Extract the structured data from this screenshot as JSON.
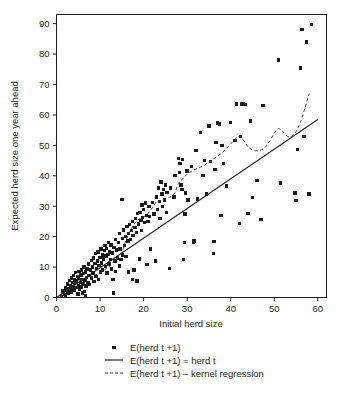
{
  "chart_data": {
    "type": "scatter",
    "title": "",
    "xlabel": "Initial herd size",
    "ylabel": "Expected herd size one year ahead",
    "xlim": [
      0,
      62
    ],
    "ylim": [
      0,
      93
    ],
    "xticks": [
      0,
      10,
      20,
      30,
      40,
      50,
      60
    ],
    "yticks": [
      0,
      10,
      20,
      30,
      40,
      50,
      60,
      70,
      80,
      90
    ],
    "grid": false,
    "legend_position": "bottom-center",
    "marker": "square",
    "marker_color": "#1a1a1a",
    "line_color": "#231f20",
    "points": [
      [
        1.2,
        0.3
      ],
      [
        1.5,
        2.1
      ],
      [
        1.8,
        1.0
      ],
      [
        2.0,
        3.2
      ],
      [
        2.1,
        0.6
      ],
      [
        2.3,
        2.6
      ],
      [
        2.5,
        4.4
      ],
      [
        2.6,
        1.5
      ],
      [
        2.8,
        3.0
      ],
      [
        3.0,
        5.6
      ],
      [
        3.1,
        2.2
      ],
      [
        3.2,
        4.0
      ],
      [
        3.4,
        6.4
      ],
      [
        3.5,
        1.8
      ],
      [
        3.6,
        3.5
      ],
      [
        3.8,
        5.0
      ],
      [
        3.9,
        7.2
      ],
      [
        4.0,
        2.5
      ],
      [
        4.1,
        4.6
      ],
      [
        4.2,
        6.0
      ],
      [
        4.4,
        8.2
      ],
      [
        4.5,
        3.2
      ],
      [
        4.6,
        5.4
      ],
      [
        4.8,
        7.0
      ],
      [
        4.9,
        1.2
      ],
      [
        5.0,
        4.0
      ],
      [
        5.1,
        6.2
      ],
      [
        5.2,
        8.6
      ],
      [
        5.3,
        2.8
      ],
      [
        5.5,
        5.0
      ],
      [
        5.6,
        7.4
      ],
      [
        5.7,
        9.0
      ],
      [
        5.8,
        3.4
      ],
      [
        5.9,
        6.0
      ],
      [
        6.0,
        1.5
      ],
      [
        6.1,
        4.4
      ],
      [
        6.2,
        7.8
      ],
      [
        6.3,
        10.0
      ],
      [
        6.4,
        2.0
      ],
      [
        6.5,
        5.6
      ],
      [
        6.6,
        8.4
      ],
      [
        6.7,
        0.5
      ],
      [
        6.8,
        3.8
      ],
      [
        6.9,
        6.6
      ],
      [
        7.0,
        9.4
      ],
      [
        7.2,
        5.0
      ],
      [
        7.4,
        11.0
      ],
      [
        7.5,
        7.2
      ],
      [
        7.6,
        4.2
      ],
      [
        7.8,
        9.0
      ],
      [
        8.0,
        12.2
      ],
      [
        8.1,
        6.4
      ],
      [
        8.2,
        10.0
      ],
      [
        8.4,
        8.0
      ],
      [
        8.5,
        13.0
      ],
      [
        8.6,
        5.2
      ],
      [
        8.8,
        11.2
      ],
      [
        9.0,
        14.4
      ],
      [
        9.1,
        7.0
      ],
      [
        9.2,
        9.6
      ],
      [
        9.4,
        12.0
      ],
      [
        9.5,
        15.0
      ],
      [
        9.6,
        6.0
      ],
      [
        9.8,
        10.6
      ],
      [
        10.0,
        13.2
      ],
      [
        10.1,
        8.4
      ],
      [
        10.2,
        16.0
      ],
      [
        10.4,
        11.4
      ],
      [
        10.5,
        14.0
      ],
      [
        10.6,
        9.0
      ],
      [
        10.8,
        12.6
      ],
      [
        11.0,
        15.4
      ],
      [
        11.1,
        17.0
      ],
      [
        11.2,
        10.2
      ],
      [
        11.4,
        13.6
      ],
      [
        11.5,
        16.2
      ],
      [
        11.6,
        8.0
      ],
      [
        11.8,
        14.2
      ],
      [
        12.0,
        18.0
      ],
      [
        12.1,
        11.0
      ],
      [
        12.2,
        15.0
      ],
      [
        12.4,
        12.4
      ],
      [
        12.5,
        17.2
      ],
      [
        12.6,
        9.4
      ],
      [
        12.8,
        14.6
      ],
      [
        13.0,
        6.0
      ],
      [
        13.1,
        1.5
      ],
      [
        13.2,
        16.4
      ],
      [
        13.4,
        12.0
      ],
      [
        13.5,
        19.0
      ],
      [
        13.6,
        8.6
      ],
      [
        13.8,
        15.6
      ],
      [
        14.0,
        13.0
      ],
      [
        14.2,
        18.0
      ],
      [
        14.4,
        10.4
      ],
      [
        14.5,
        21.0
      ],
      [
        14.6,
        16.0
      ],
      [
        14.8,
        12.4
      ],
      [
        15.0,
        32.2
      ],
      [
        15.1,
        19.4
      ],
      [
        15.2,
        14.0
      ],
      [
        15.4,
        22.2
      ],
      [
        15.6,
        17.0
      ],
      [
        15.8,
        20.0
      ],
      [
        16.0,
        13.4
      ],
      [
        16.2,
        23.4
      ],
      [
        16.4,
        18.6
      ],
      [
        16.5,
        21.0
      ],
      [
        16.6,
        8.4
      ],
      [
        16.8,
        24.0
      ],
      [
        17.0,
        19.0
      ],
      [
        17.2,
        22.0
      ],
      [
        17.4,
        6.0
      ],
      [
        17.5,
        25.0
      ],
      [
        17.6,
        20.4
      ],
      [
        17.8,
        9.0
      ],
      [
        18.0,
        23.0
      ],
      [
        18.2,
        26.0
      ],
      [
        18.4,
        21.4
      ],
      [
        18.5,
        5.4
      ],
      [
        18.6,
        27.6
      ],
      [
        18.8,
        24.2
      ],
      [
        19.0,
        12.6
      ],
      [
        19.2,
        28.0
      ],
      [
        19.4,
        25.4
      ],
      [
        19.5,
        22.0
      ],
      [
        19.6,
        30.4
      ],
      [
        19.8,
        26.2
      ],
      [
        20.0,
        29.0
      ],
      [
        20.2,
        24.6
      ],
      [
        20.4,
        31.0
      ],
      [
        20.6,
        27.0
      ],
      [
        20.8,
        10.8
      ],
      [
        21.0,
        25.0
      ],
      [
        21.2,
        30.0
      ],
      [
        21.4,
        26.6
      ],
      [
        21.6,
        16.0
      ],
      [
        22.0,
        31.2
      ],
      [
        22.4,
        27.4
      ],
      [
        22.8,
        12.0
      ],
      [
        23.0,
        33.0
      ],
      [
        23.2,
        29.0
      ],
      [
        23.4,
        36.0
      ],
      [
        23.6,
        31.6
      ],
      [
        23.8,
        26.0
      ],
      [
        24.0,
        38.0
      ],
      [
        24.2,
        34.0
      ],
      [
        24.4,
        30.0
      ],
      [
        24.6,
        35.4
      ],
      [
        24.8,
        32.0
      ],
      [
        25.0,
        37.0
      ],
      [
        25.2,
        28.0
      ],
      [
        25.4,
        34.6
      ],
      [
        26.0,
        9.6
      ],
      [
        26.2,
        36.0
      ],
      [
        27.0,
        33.0
      ],
      [
        27.2,
        40.0
      ],
      [
        28.0,
        45.6
      ],
      [
        28.2,
        41.0
      ],
      [
        28.4,
        44.0
      ],
      [
        28.6,
        37.0
      ],
      [
        28.8,
        35.4
      ],
      [
        29.0,
        45.4
      ],
      [
        29.2,
        12.4
      ],
      [
        29.4,
        18.0
      ],
      [
        29.5,
        27.4
      ],
      [
        29.6,
        34.4
      ],
      [
        30.0,
        41.6
      ],
      [
        30.2,
        32.0
      ],
      [
        31.0,
        43.0
      ],
      [
        31.4,
        18.2
      ],
      [
        31.6,
        18.6
      ],
      [
        32.0,
        48.4
      ],
      [
        32.4,
        32.4
      ],
      [
        33.0,
        54.2
      ],
      [
        33.6,
        40.0
      ],
      [
        34.0,
        45.0
      ],
      [
        34.4,
        34.0
      ],
      [
        35.0,
        56.4
      ],
      [
        35.4,
        44.6
      ],
      [
        36.0,
        14.4
      ],
      [
        36.2,
        18.4
      ],
      [
        36.4,
        42.0
      ],
      [
        36.6,
        51.0
      ],
      [
        37.0,
        57.4
      ],
      [
        37.4,
        57.0
      ],
      [
        37.8,
        27.0
      ],
      [
        38.0,
        50.0
      ],
      [
        38.4,
        44.0
      ],
      [
        39.0,
        36.6
      ],
      [
        40.0,
        57.6
      ],
      [
        41.0,
        51.6
      ],
      [
        41.4,
        63.6
      ],
      [
        42.0,
        24.4
      ],
      [
        42.2,
        53.0
      ],
      [
        42.6,
        63.6
      ],
      [
        43.0,
        63.6
      ],
      [
        43.4,
        63.4
      ],
      [
        44.0,
        27.6
      ],
      [
        44.6,
        58.0
      ],
      [
        45.0,
        32.8
      ],
      [
        46.0,
        38.4
      ],
      [
        47.0,
        25.6
      ],
      [
        47.4,
        63.0
      ],
      [
        51.0,
        78.0
      ],
      [
        51.4,
        37.6
      ],
      [
        54.8,
        34.4
      ],
      [
        55.0,
        31.8
      ],
      [
        55.4,
        48.6
      ],
      [
        56.0,
        75.4
      ],
      [
        56.4,
        88.0
      ],
      [
        56.8,
        53.0
      ],
      [
        57.4,
        84.0
      ],
      [
        58.0,
        34.0
      ],
      [
        58.6,
        89.8
      ]
    ],
    "identity_line": {
      "label": "E(herd t +1) = herd t",
      "style": "solid",
      "from": [
        0,
        0
      ],
      "to": [
        60,
        58.5
      ]
    },
    "kernel_regression": {
      "label": "E(herd t +1) – kernel regression",
      "style": "dashed",
      "x": [
        1,
        3,
        5,
        7,
        9,
        11,
        13,
        15,
        16,
        17,
        18,
        19,
        20,
        21,
        22,
        23,
        24,
        25,
        26,
        27,
        28,
        29,
        30,
        31,
        32,
        33,
        34,
        35,
        36,
        37,
        38,
        39,
        40,
        41,
        42,
        43,
        44,
        45,
        46,
        47,
        48,
        49,
        50,
        51,
        52,
        53,
        54,
        55,
        56,
        57,
        58
      ],
      "y": [
        1.0,
        3.0,
        5.5,
        6.5,
        7.5,
        9.0,
        11.5,
        15.0,
        19.0,
        22.0,
        24.5,
        25.8,
        26.5,
        27.6,
        29.5,
        31.5,
        31.8,
        32.5,
        33.0,
        34.0,
        37.5,
        39.0,
        40.5,
        41.5,
        42.2,
        42.8,
        43.5,
        44.5,
        45.5,
        46.5,
        47.5,
        49.0,
        50.5,
        52.0,
        53.0,
        51.5,
        49.5,
        48.5,
        48.2,
        48.5,
        49.5,
        51.5,
        54.0,
        55.5,
        54.5,
        53.0,
        53.0,
        54.5,
        57.5,
        62.0,
        67.0
      ]
    }
  },
  "axes": {
    "x_title": "Initial herd size",
    "y_title": "Expected herd size one year ahead",
    "x_tick_labels": [
      "0",
      "10",
      "20",
      "30",
      "40",
      "50",
      "60"
    ],
    "y_tick_labels": [
      "0",
      "10",
      "20",
      "30",
      "40",
      "50",
      "60",
      "70",
      "80",
      "90"
    ]
  },
  "legend": {
    "entries": [
      {
        "marker": "square-marker",
        "label": "E(herd t +1)"
      },
      {
        "marker": "solid-line",
        "label": "E(herd t +1) = herd t"
      },
      {
        "marker": "dashed-line",
        "label": "E(herd t +1) – kernel regression"
      }
    ]
  }
}
